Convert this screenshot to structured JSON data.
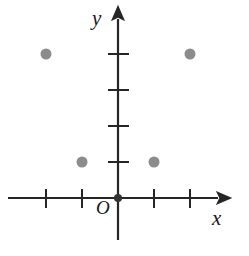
{
  "figure": {
    "width": 249,
    "height": 256,
    "background_color": "#ffffff"
  },
  "axes": {
    "origin_label": "O",
    "x_axis_label": "x",
    "y_axis_label": "y",
    "axis_color": "#262626",
    "origin_dot_color": "#333333"
  },
  "chart_data": {
    "type": "scatter",
    "title": "",
    "xlabel": "x",
    "ylabel": "y",
    "origin_label": "O",
    "grid": false,
    "legend": null,
    "xlim": [
      -3,
      3
    ],
    "ylim": [
      -1,
      5
    ],
    "x_ticks": [
      -2,
      -1,
      1,
      2
    ],
    "y_ticks": [
      1,
      2,
      3,
      4
    ],
    "x_tick_labels": [
      "",
      "",
      "",
      ""
    ],
    "y_tick_labels": [
      "",
      "",
      "",
      ""
    ],
    "unit_px": 36,
    "point_color": "#8c8c8c",
    "point_radius_px": 5.5,
    "points": [
      {
        "x": -2,
        "y": 4
      },
      {
        "x": 2,
        "y": 4
      },
      {
        "x": -1,
        "y": 1
      },
      {
        "x": 1,
        "y": 1
      }
    ]
  }
}
